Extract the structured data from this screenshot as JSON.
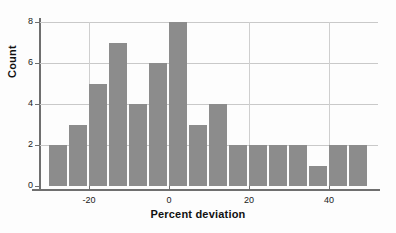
{
  "chart_data": {
    "type": "bar",
    "title": "",
    "xlabel": "Percent deviation",
    "ylabel": "Count",
    "xlim": [
      -30,
      50
    ],
    "ylim": [
      0,
      8
    ],
    "bin_width": 5,
    "grid": true,
    "legend": "none",
    "bar_color": "#8c8c8c",
    "axis_color": "#6f6f6f",
    "grid_color": "#c9c9c9",
    "xticks": [
      {
        "value": -20,
        "label": "-20"
      },
      {
        "value": 0,
        "label": "0"
      },
      {
        "value": 20,
        "label": "20"
      },
      {
        "value": 40,
        "label": "40"
      }
    ],
    "yticks": [
      {
        "value": 0,
        "label": "0"
      },
      {
        "value": 2,
        "label": "2"
      },
      {
        "value": 4,
        "label": "4"
      },
      {
        "value": 6,
        "label": "6"
      },
      {
        "value": 8,
        "label": "8"
      }
    ],
    "bins": [
      {
        "start": -30,
        "end": -25,
        "center": -27.5,
        "count": 2
      },
      {
        "start": -25,
        "end": -20,
        "center": -22.5,
        "count": 3
      },
      {
        "start": -20,
        "end": -15,
        "center": -17.5,
        "count": 5
      },
      {
        "start": -15,
        "end": -10,
        "center": -12.5,
        "count": 7
      },
      {
        "start": -10,
        "end": -5,
        "center": -7.5,
        "count": 4
      },
      {
        "start": -5,
        "end": 0,
        "center": -2.5,
        "count": 6
      },
      {
        "start": 0,
        "end": 5,
        "center": 2.5,
        "count": 8
      },
      {
        "start": 5,
        "end": 10,
        "center": 7.5,
        "count": 3
      },
      {
        "start": 10,
        "end": 15,
        "center": 12.5,
        "count": 4
      },
      {
        "start": 15,
        "end": 20,
        "center": 17.5,
        "count": 2
      },
      {
        "start": 20,
        "end": 25,
        "center": 22.5,
        "count": 2
      },
      {
        "start": 25,
        "end": 30,
        "center": 27.5,
        "count": 2
      },
      {
        "start": 30,
        "end": 35,
        "center": 32.5,
        "count": 2
      },
      {
        "start": 35,
        "end": 40,
        "center": 37.5,
        "count": 1
      },
      {
        "start": 40,
        "end": 45,
        "center": 42.5,
        "count": 2
      },
      {
        "start": 45,
        "end": 50,
        "center": 47.5,
        "count": 2
      }
    ],
    "categories": [
      "-30 to -25",
      "-25 to -20",
      "-20 to -15",
      "-15 to -10",
      "-10 to -5",
      "-5 to 0",
      "0 to 5",
      "5 to 10",
      "10 to 15",
      "15 to 20",
      "20 to 25",
      "25 to 30",
      "30 to 35",
      "35 to 40",
      "40 to 45",
      "45 to 50"
    ],
    "values": [
      2,
      3,
      5,
      7,
      4,
      6,
      8,
      3,
      4,
      2,
      2,
      2,
      2,
      1,
      2,
      2
    ]
  }
}
